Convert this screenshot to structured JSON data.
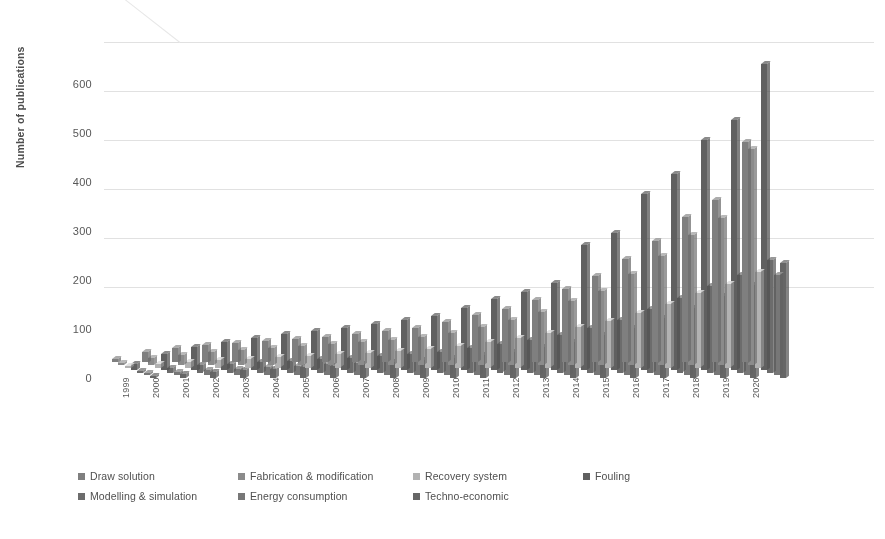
{
  "chart_data": {
    "type": "bar",
    "title": "",
    "subtitle": "",
    "xlabel": "",
    "ylabel": "Number of publications",
    "ylim": [
      0,
      650
    ],
    "yticks": [
      0,
      100,
      200,
      300,
      400,
      500,
      600
    ],
    "grid": true,
    "legend_position": "bottom",
    "three_d": true,
    "categories": [
      "1999",
      "2000",
      "2001",
      "2002",
      "2003",
      "2004",
      "2005",
      "2006",
      "2007",
      "2008",
      "2009",
      "2010",
      "2011",
      "2012",
      "2013",
      "2014",
      "2015",
      "2016",
      "2017",
      "2018",
      "2019",
      "2020"
    ],
    "series": [
      {
        "name": "Draw solution",
        "color": "#7f7f7f",
        "values": [
          8,
          22,
          30,
          36,
          40,
          44,
          48,
          52,
          58,
          64,
          70,
          82,
          96,
          110,
          128,
          150,
          176,
          212,
          248,
          296,
          332,
          450
        ]
      },
      {
        "name": "Fabrication & modification",
        "color": "#8c8c8c",
        "values": [
          5,
          14,
          20,
          26,
          30,
          34,
          38,
          42,
          46,
          52,
          58,
          66,
          78,
          92,
          108,
          130,
          152,
          186,
          222,
          266,
          300,
          440
        ]
      },
      {
        "name": "Recovery system",
        "color": "#b5b5b5",
        "values": [
          3,
          8,
          12,
          15,
          18,
          21,
          24,
          27,
          30,
          34,
          38,
          44,
          52,
          60,
          70,
          82,
          96,
          112,
          130,
          152,
          170,
          195
        ]
      },
      {
        "name": "Fouling",
        "color": "#5e5e5e",
        "values": [
          12,
          34,
          48,
          58,
          66,
          74,
          80,
          86,
          94,
          102,
          110,
          126,
          145,
          160,
          178,
          255,
          280,
          360,
          400,
          470,
          510,
          625
        ]
      },
      {
        "name": "Modelling & simulation",
        "color": "#6b6b6b",
        "values": [
          4,
          10,
          15,
          19,
          22,
          25,
          28,
          31,
          35,
          39,
          43,
          50,
          58,
          67,
          78,
          92,
          108,
          130,
          152,
          178,
          200,
          230
        ]
      },
      {
        "name": "Energy consumption",
        "color": "#777777",
        "values": [
          2,
          7,
          11,
          14,
          17,
          20,
          23,
          26,
          29,
          33,
          37,
          43,
          50,
          58,
          68,
          80,
          94,
          112,
          132,
          155,
          176,
          205
        ]
      },
      {
        "name": "Techno-economic",
        "color": "#656565",
        "values": [
          3,
          9,
          13,
          16,
          19,
          22,
          25,
          28,
          32,
          36,
          40,
          46,
          54,
          63,
          74,
          87,
          102,
          122,
          143,
          168,
          190,
          235
        ]
      }
    ]
  },
  "y_axis": {
    "title": "Number of publications",
    "ticks": [
      "600",
      "500",
      "400",
      "300",
      "200",
      "100",
      "0"
    ]
  },
  "legend": {
    "items": [
      {
        "label": "Draw solution",
        "color": "#7f7f7f"
      },
      {
        "label": "Fabrication & modification",
        "color": "#8c8c8c"
      },
      {
        "label": "Recovery system",
        "color": "#b5b5b5"
      },
      {
        "label": "Fouling",
        "color": "#5e5e5e"
      },
      {
        "label": "Modelling & simulation",
        "color": "#6b6b6b"
      },
      {
        "label": "Energy consumption",
        "color": "#777777"
      },
      {
        "label": "Techno-economic",
        "color": "#656565"
      }
    ]
  }
}
